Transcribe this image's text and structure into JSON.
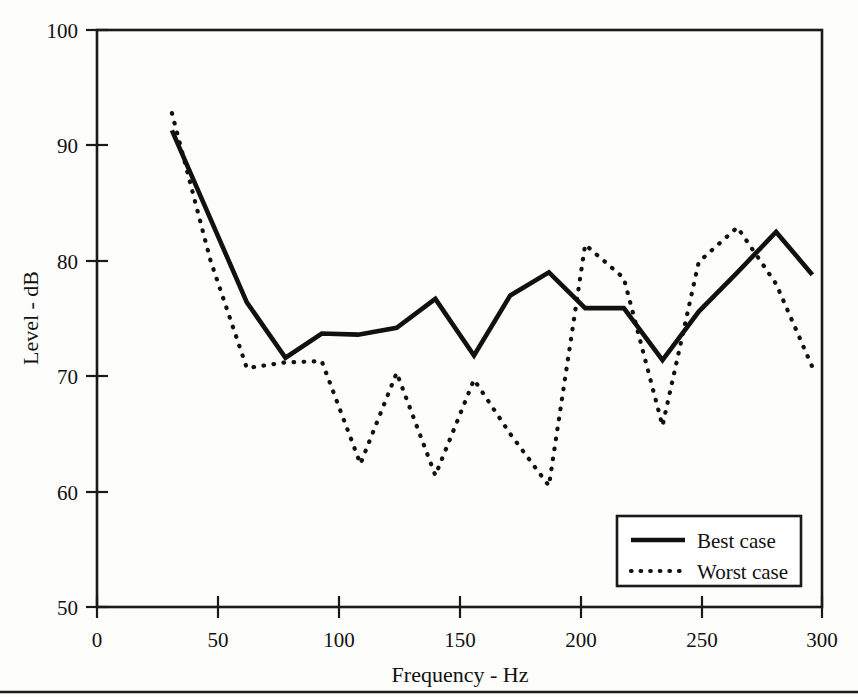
{
  "chart_data": {
    "type": "line",
    "title": "",
    "xlabel": "Frequency - Hz",
    "ylabel": "Level - dB",
    "xlim": [
      0,
      300
    ],
    "ylim": [
      50,
      100
    ],
    "xticks": [
      0,
      50,
      100,
      150,
      200,
      250,
      300
    ],
    "yticks": [
      50,
      60,
      70,
      80,
      90,
      100
    ],
    "xtick_labels": [
      "0",
      "50",
      "100",
      "150",
      "200",
      "250",
      "300"
    ],
    "ytick_labels": [
      "50",
      "60",
      "70",
      "80",
      "90",
      "100"
    ],
    "grid": false,
    "legend_position": "bottom-right",
    "series": [
      {
        "name": "Best case",
        "style": "solid",
        "color": "#111111",
        "x": [
          31,
          62,
          78,
          93,
          108,
          124,
          140,
          156,
          171,
          187,
          202,
          218,
          234,
          249,
          265,
          281,
          296
        ],
        "y": [
          91.3,
          76.4,
          71.6,
          73.7,
          73.6,
          74.2,
          76.7,
          71.8,
          77.0,
          79.0,
          75.9,
          75.9,
          71.4,
          75.6,
          79.0,
          82.5,
          78.8
        ]
      },
      {
        "name": "Worst case",
        "style": "dotted",
        "color": "#111111",
        "x": [
          31,
          47,
          62,
          78,
          93,
          109,
          124,
          140,
          156,
          171,
          187,
          202,
          218,
          234,
          249,
          265,
          281,
          296
        ],
        "y": [
          92.8,
          80.0,
          70.7,
          71.2,
          71.3,
          62.4,
          70.3,
          61.4,
          69.7,
          65.0,
          60.5,
          81.4,
          78.5,
          65.7,
          79.9,
          82.9,
          78.0,
          70.8
        ]
      }
    ]
  },
  "axes": {
    "y_title": "Level - dB",
    "x_title": "Frequency - Hz",
    "y_labels": {
      "t100": "100",
      "t90": "90",
      "t80": "80",
      "t70": "70",
      "t60": "60",
      "t50": "50"
    },
    "x_labels": {
      "t0": "0",
      "t50": "50",
      "t100": "100",
      "t150": "150",
      "t200": "200",
      "t250": "250",
      "t300": "300"
    }
  },
  "legend": {
    "entries": [
      {
        "label": "Best case",
        "style": "solid"
      },
      {
        "label": "Worst case",
        "style": "dotted"
      }
    ],
    "item0_label": "Best case",
    "item1_label": "Worst case"
  },
  "colors": {
    "ink": "#111111",
    "background": "#fdfdfb"
  }
}
